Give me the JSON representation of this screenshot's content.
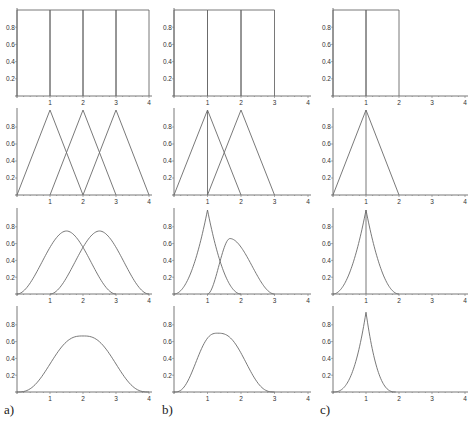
{
  "chart_data": [
    {
      "panel": "a)",
      "type": "line",
      "title": "",
      "xlim": [
        0,
        4
      ],
      "ylim": [
        0,
        1
      ],
      "xticks": [
        "1",
        "2",
        "3",
        "4"
      ],
      "yticks": [
        "0.2",
        "0.4",
        "0.6",
        "0.8"
      ],
      "rows": [
        {
          "kind": "box",
          "curves": [
            {
              "name": "B0 on [0,1]",
              "support": [
                0,
                1
              ],
              "peak_x": 0.5,
              "peak_y": 1
            },
            {
              "name": "B0 on [1,2]",
              "support": [
                1,
                2
              ],
              "peak_x": 1.5,
              "peak_y": 1
            },
            {
              "name": "B0 on [2,3]",
              "support": [
                2,
                3
              ],
              "peak_x": 2.5,
              "peak_y": 1
            },
            {
              "name": "B0 on [3,4]",
              "support": [
                3,
                4
              ],
              "peak_x": 3.5,
              "peak_y": 1
            }
          ]
        },
        {
          "kind": "triangle",
          "curves": [
            {
              "name": "B1 at 1",
              "support": [
                0,
                2
              ],
              "peak_x": 1,
              "peak_y": 1
            },
            {
              "name": "B1 at 2",
              "support": [
                1,
                3
              ],
              "peak_x": 2,
              "peak_y": 1
            },
            {
              "name": "B1 at 3",
              "support": [
                2,
                4
              ],
              "peak_x": 3,
              "peak_y": 1
            }
          ]
        },
        {
          "kind": "quadratic",
          "curves": [
            {
              "name": "B2 on [0,3]",
              "support": [
                0,
                3
              ],
              "peak_x": 1.5,
              "peak_y": 0.75
            },
            {
              "name": "B2 on [1,4]",
              "support": [
                1,
                4
              ],
              "peak_x": 2.5,
              "peak_y": 0.75
            }
          ]
        },
        {
          "kind": "cubic",
          "curves": [
            {
              "name": "B3 on [0,4]",
              "support": [
                0,
                4
              ],
              "peak_x": 2,
              "peak_y": 0.667
            }
          ]
        }
      ]
    },
    {
      "panel": "b)",
      "type": "line",
      "title": "",
      "xlim": [
        0,
        4
      ],
      "ylim": [
        0,
        1
      ],
      "xticks": [
        "1",
        "2",
        "3",
        "4"
      ],
      "yticks": [
        "0.2",
        "0.4",
        "0.6",
        "0.8"
      ],
      "rows": [
        {
          "kind": "box",
          "curves": [
            {
              "name": "B0 on [0,1]",
              "support": [
                0,
                1
              ],
              "peak_x": 0.5,
              "peak_y": 1
            },
            {
              "name": "B0 on [1,2]",
              "support": [
                1,
                2
              ],
              "peak_x": 1.5,
              "peak_y": 1
            },
            {
              "name": "B0 on [2,3]",
              "support": [
                2,
                3
              ],
              "peak_x": 2.5,
              "peak_y": 1
            }
          ]
        },
        {
          "kind": "triangle",
          "curves": [
            {
              "name": "B1 at 1",
              "support": [
                0,
                2
              ],
              "peak_x": 1,
              "peak_y": 1
            },
            {
              "name": "B1 at 2",
              "support": [
                1,
                3
              ],
              "peak_x": 2,
              "peak_y": 1
            },
            {
              "name": "knot line at 1",
              "support": [
                1,
                1
              ],
              "peak_x": 1,
              "peak_y": 1
            }
          ]
        },
        {
          "kind": "quadratic",
          "curves": [
            {
              "name": "B2 on [0,2]",
              "support": [
                0,
                2
              ],
              "peak_x": 1,
              "peak_y": 1
            },
            {
              "name": "B2 on [1,3]",
              "support": [
                1,
                3
              ],
              "peak_x": 1.67,
              "peak_y": 0.66
            }
          ]
        },
        {
          "kind": "cubic",
          "curves": [
            {
              "name": "B3 on [0,3]",
              "support": [
                0,
                3
              ],
              "peak_x": 1.3,
              "peak_y": 0.7
            }
          ]
        }
      ]
    },
    {
      "panel": "c)",
      "type": "line",
      "title": "",
      "xlim": [
        0,
        4
      ],
      "ylim": [
        0,
        1
      ],
      "xticks": [
        "1",
        "2",
        "3",
        "4"
      ],
      "yticks": [
        "0.2",
        "0.4",
        "0.6",
        "0.8"
      ],
      "rows": [
        {
          "kind": "box",
          "curves": [
            {
              "name": "B0 on [0,1]",
              "support": [
                0,
                1
              ],
              "peak_x": 0.5,
              "peak_y": 1
            },
            {
              "name": "B0 on [1,2]",
              "support": [
                1,
                2
              ],
              "peak_x": 1.5,
              "peak_y": 1
            }
          ]
        },
        {
          "kind": "triangle",
          "curves": [
            {
              "name": "B1 at 1",
              "support": [
                0,
                2
              ],
              "peak_x": 1,
              "peak_y": 1
            },
            {
              "name": "knot line at 1",
              "support": [
                1,
                1
              ],
              "peak_x": 1,
              "peak_y": 1
            }
          ]
        },
        {
          "kind": "quadratic",
          "curves": [
            {
              "name": "B2 cusp at 1",
              "support": [
                0,
                2
              ],
              "peak_x": 1,
              "peak_y": 1
            },
            {
              "name": "knot line at 1",
              "support": [
                1,
                1
              ],
              "peak_x": 1,
              "peak_y": 1
            }
          ]
        },
        {
          "kind": "cubic",
          "curves": [
            {
              "name": "B3 cusp at 1",
              "support": [
                0,
                1.9
              ],
              "peak_x": 1,
              "peak_y": 0.95
            }
          ]
        }
      ]
    }
  ]
}
